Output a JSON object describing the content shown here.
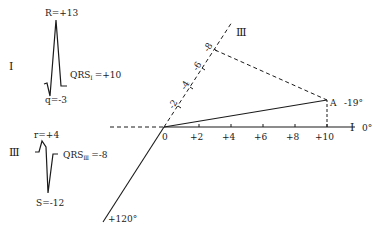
{
  "diagram": {
    "type": "ecg-axis-construction",
    "lead_I": {
      "label": "I",
      "r_label": "R=+13",
      "q_label": "q=-3",
      "qrs_label_prefix": "QRS",
      "qrs_subscript": "I",
      "qrs_value": "=+10"
    },
    "lead_III": {
      "label": "Ⅲ",
      "r_label": "r=+4",
      "s_label": "S=-12",
      "qrs_label_prefix": "QRS",
      "qrs_subscript": "Ⅲ",
      "qrs_value": "=-8"
    },
    "axes": {
      "lead_I_axis_label": "I",
      "lead_I_angle": "0°",
      "lead_III_axis_label": "Ⅲ",
      "lead_III_angle": "+120°",
      "origin_label": "0",
      "lead_I_ticks": [
        "+2",
        "+4",
        "+6",
        "+8",
        "+10"
      ],
      "lead_III_ticks": [
        "-2",
        "-4",
        "-6",
        "-8"
      ]
    },
    "result": {
      "point_label": "A",
      "angle": "-19°"
    }
  }
}
